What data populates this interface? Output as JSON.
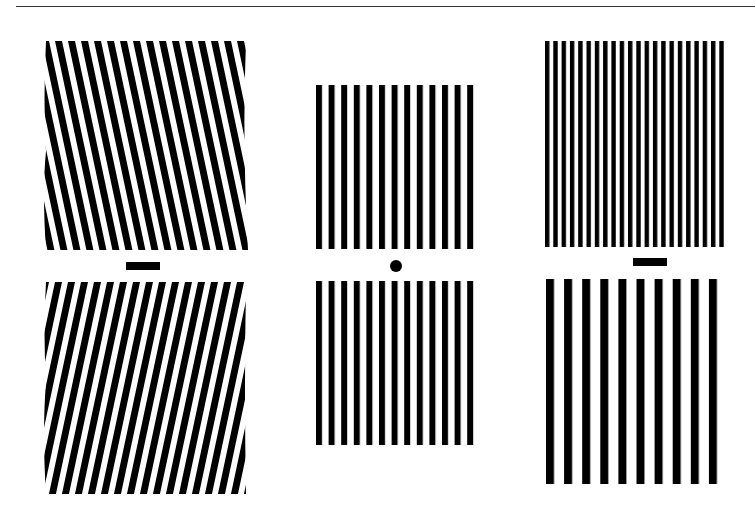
{
  "figure": {
    "colors": {
      "bar": "#000000",
      "background": "#ffffff",
      "rule": "#333333"
    },
    "columns": [
      {
        "name": "tilt-adaptation",
        "top_grating": {
          "orientation": "tilted-left",
          "tilt_deg": -12,
          "bars": 16,
          "period_px": 13
        },
        "fixation_marker": "bar",
        "bottom_grating": {
          "orientation": "tilted-right",
          "tilt_deg": 12,
          "bars": 16,
          "period_px": 13
        }
      },
      {
        "name": "test-pattern",
        "top_grating": {
          "orientation": "vertical",
          "bars": 13,
          "period_px": 12.6
        },
        "fixation_marker": "dot",
        "bottom_grating": {
          "orientation": "vertical",
          "bars": 13,
          "period_px": 12.6
        }
      },
      {
        "name": "frequency-adaptation",
        "top_grating": {
          "orientation": "vertical",
          "bars": 22,
          "period_px": 8.3,
          "spatial_frequency": "high"
        },
        "fixation_marker": "bar",
        "bottom_grating": {
          "orientation": "vertical",
          "bars": 10,
          "period_px": 18.1,
          "spatial_frequency": "low"
        }
      }
    ]
  }
}
